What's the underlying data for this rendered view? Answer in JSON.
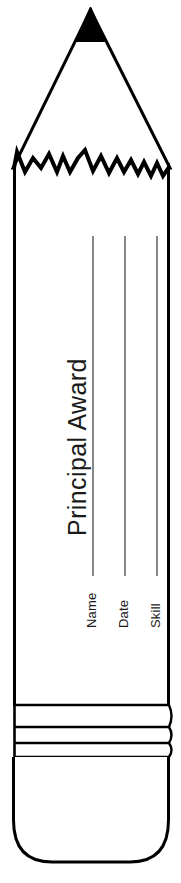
{
  "document": {
    "type": "award-certificate-template",
    "shape": "pencil",
    "title": "Principal Award",
    "fields": [
      {
        "id": "name",
        "label": "Name",
        "value": ""
      },
      {
        "id": "date",
        "label": "Date",
        "value": ""
      },
      {
        "id": "skill",
        "label": "Skill",
        "value": ""
      }
    ],
    "icons": {
      "graphite_tip": "pencil-tip-icon",
      "wood_collar": "sharpened-wood-jagged-icon",
      "ferrule": "ferrule-bands-icon",
      "eraser": "eraser-icon"
    },
    "colors": {
      "outline": "#000000",
      "graphite": "#000000",
      "paper": "#ffffff",
      "rule_line": "#555555",
      "text": "#1a1a1a"
    }
  }
}
